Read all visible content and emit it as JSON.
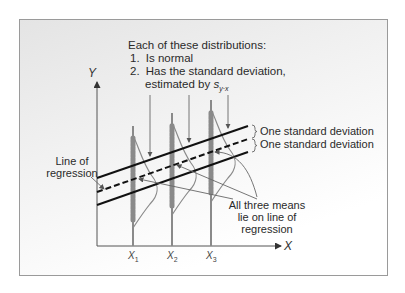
{
  "title": "Each of these distributions:",
  "properties": [
    {
      "num": "1.",
      "text": "Is normal"
    },
    {
      "num": "2.",
      "text": "Has the standard deviation,"
    }
  ],
  "estimated_line": "estimated by ",
  "estimator_symbol": "s",
  "estimator_subscript": "y·x",
  "axes": {
    "y_label": "Y",
    "x_label": "X"
  },
  "ticks": [
    {
      "base": "X",
      "sub": "1"
    },
    {
      "base": "X",
      "sub": "2"
    },
    {
      "base": "X",
      "sub": "3"
    }
  ],
  "labels": {
    "line_of_regression_1": "Line of",
    "line_of_regression_2": "regression",
    "std_dev_upper": "One standard deviation",
    "std_dev_lower": "One standard deviation",
    "means_1": "All three means",
    "means_2": "lie on line of",
    "means_3": "regression"
  },
  "colors": {
    "line": "#111111",
    "distribution": "#8a8a8a",
    "arrow": "#666666",
    "frame": "#9a9a9a"
  }
}
